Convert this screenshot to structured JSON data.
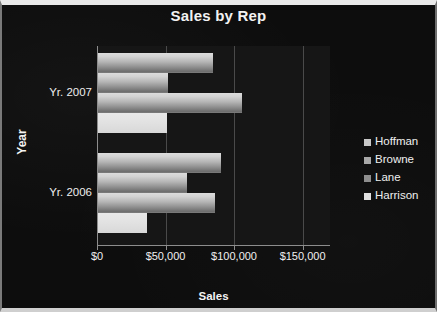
{
  "chart": {
    "title": "Sales by Rep",
    "xaxis_title": "Sales",
    "yaxis_title": "Year"
  },
  "legend": {
    "items": [
      {
        "label": "Hoffman",
        "swatch_color": "#c8c8c8"
      },
      {
        "label": "Browne",
        "swatch_color": "#a8a8a8"
      },
      {
        "label": "Lane",
        "swatch_color": "#8e8e8e"
      },
      {
        "label": "Harrison",
        "swatch_color": "#e0e0e0"
      }
    ]
  },
  "axis": {
    "x_ticks": [
      "$0",
      "$50,000",
      "$100,000",
      "$150,000"
    ],
    "y_categories": [
      "Yr. 2007",
      "Yr. 2006"
    ]
  },
  "chart_data": {
    "type": "bar",
    "orientation": "horizontal",
    "title": "Sales by Rep",
    "xlabel": "Sales",
    "ylabel": "Year",
    "categories": [
      "Yr. 2007",
      "Yr. 2006"
    ],
    "xlim": [
      0,
      170000
    ],
    "xtick_values": [
      0,
      50000,
      100000,
      150000
    ],
    "xtick_labels": [
      "$0",
      "$50,000",
      "$100,000",
      "$150,000"
    ],
    "grid": true,
    "legend_position": "right",
    "series": [
      {
        "name": "Hoffman",
        "values": [
          84000,
          90000
        ]
      },
      {
        "name": "Browne",
        "values": [
          51000,
          65000
        ]
      },
      {
        "name": "Lane",
        "values": [
          105000,
          85000
        ]
      },
      {
        "name": "Harrison",
        "values": [
          50000,
          36000
        ]
      }
    ]
  }
}
